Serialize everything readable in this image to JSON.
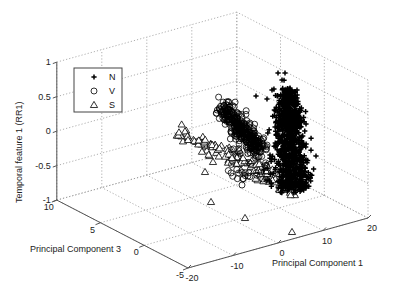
{
  "chart_data": {
    "type": "scatter",
    "subtype": "scatter3d",
    "title": "",
    "xlabel": "Principal Component 1",
    "ylabel": "Principal Component 3",
    "zlabel": "Temporal feature 1 (RR1)",
    "xlim": [
      -20,
      20
    ],
    "ylim": [
      -5,
      10
    ],
    "zlim": [
      -1,
      1
    ],
    "xticks": [
      -20,
      -10,
      0,
      10,
      20
    ],
    "yticks": [
      -5,
      0,
      5,
      10
    ],
    "zticks": [
      -1,
      -0.5,
      0,
      0.5,
      1
    ],
    "xtick_labels": [
      "-20",
      "-10",
      "0",
      "10",
      "20"
    ],
    "ytick_labels": [
      "-5",
      "0",
      "5",
      "10"
    ],
    "ztick_labels": [
      "-1",
      "-0.5",
      "0",
      "0.5",
      "1"
    ],
    "grid": true,
    "legend_position": "upper-left",
    "legend": [
      {
        "label": "N",
        "marker": "plus"
      },
      {
        "label": "V",
        "marker": "circle"
      },
      {
        "label": "S",
        "marker": "triangle"
      }
    ],
    "series": [
      {
        "name": "N",
        "marker": "plus",
        "description": "Large dense cluster, approx PC1 in [0, 8], PC3 in [-2, 2], temporal feature in [-0.6, 0.9]",
        "cluster": {
          "pc1_center": 4,
          "pc1_spread": 3,
          "pc3_center": 0,
          "pc3_spread": 1.5,
          "z_center": 0.05,
          "z_spread": 0.35,
          "count": 600
        },
        "sample_points": [
          [
            4,
            0,
            0.9
          ],
          [
            5,
            0,
            0.85
          ],
          [
            3,
            -1,
            0.6
          ],
          [
            6,
            1,
            0.5
          ],
          [
            4,
            0,
            0.2
          ],
          [
            5,
            -1,
            0
          ],
          [
            3,
            1,
            -0.2
          ],
          [
            6,
            0,
            -0.4
          ],
          [
            5,
            -1,
            -0.55
          ],
          [
            7,
            -2,
            -0.6
          ]
        ]
      },
      {
        "name": "V",
        "marker": "circle",
        "description": "Elongated dense cluster, approx PC1 in [-8, -2], PC3 in [2, 6], temporal feature in [-0.4, 0.4]",
        "cluster": {
          "pc1_center": -5,
          "pc1_spread": 2,
          "pc3_center": 4,
          "pc3_spread": 1,
          "z_center": 0.05,
          "z_spread": 0.25,
          "count": 260
        },
        "sample_points": [
          [
            -8,
            6,
            0.35
          ],
          [
            -6,
            5,
            0.25
          ],
          [
            -5,
            4,
            0.1
          ],
          [
            -4,
            4,
            -0.05
          ],
          [
            -3,
            3,
            -0.2
          ],
          [
            -2,
            2,
            -0.35
          ],
          [
            -1,
            0,
            -0.4
          ],
          [
            -3,
            1,
            -0.55
          ]
        ]
      },
      {
        "name": "S",
        "marker": "triangle",
        "description": "Band of points, approx PC1 in [-14, 0], PC3 in [2, 8], temporal feature in [-0.8, -0.1]",
        "cluster": {
          "pc1_center": -7,
          "pc1_spread": 4,
          "pc3_center": 5,
          "pc3_spread": 1.5,
          "z_center": -0.4,
          "z_spread": 0.15,
          "count": 120
        },
        "sample_points": [
          [
            -14,
            8,
            -0.1
          ],
          [
            -12,
            7,
            -0.2
          ],
          [
            -10,
            6,
            -0.3
          ],
          [
            -8,
            5,
            -0.4
          ],
          [
            -6,
            4,
            -0.45
          ],
          [
            -4,
            3,
            -0.55
          ],
          [
            -2,
            2,
            -0.6
          ],
          [
            -8,
            0,
            -0.85
          ],
          [
            0,
            -1,
            -0.8
          ]
        ]
      }
    ]
  }
}
